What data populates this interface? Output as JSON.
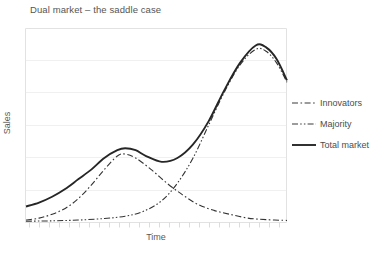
{
  "chart_data": {
    "type": "line",
    "title": "Dual market – the saddle case",
    "xlabel": "Time",
    "ylabel": "Sales",
    "grid": true,
    "grid_axis": "y",
    "xlim": [
      0,
      100
    ],
    "ylim": [
      0,
      100
    ],
    "x_ticks_labeled": false,
    "y_ticks_labeled": false,
    "legend_position": "right",
    "legend": [
      "Innovators",
      "Majority",
      "Total market"
    ],
    "series": [
      {
        "name": "Innovators",
        "style": "dash-dot",
        "color": "#333333",
        "peak_x": 38,
        "peak_y": 35,
        "x": [
          0,
          5,
          10,
          15,
          20,
          25,
          30,
          35,
          38,
          42,
          48,
          54,
          60,
          66,
          72,
          78,
          85,
          92,
          100
        ],
        "y": [
          1,
          2,
          4,
          7,
          12,
          19,
          27,
          34,
          35,
          33,
          27,
          20,
          14,
          9,
          6,
          4,
          2,
          1.2,
          0.8
        ]
      },
      {
        "name": "Majority",
        "style": "dash-dot-dot",
        "color": "#333333",
        "peak_x": 88,
        "peak_y": 89,
        "x": [
          0,
          10,
          20,
          30,
          38,
          45,
          52,
          58,
          64,
          70,
          76,
          82,
          88,
          92,
          96,
          100
        ],
        "y": [
          0.4,
          0.6,
          1.0,
          1.8,
          3.0,
          5.5,
          11,
          20,
          33,
          50,
          67,
          81,
          89,
          88,
          82,
          72
        ]
      },
      {
        "name": "Total market",
        "style": "solid",
        "color": "#262626",
        "hump1_x": 38,
        "hump1_y": 38,
        "saddle_x": 52,
        "saddle_y": 31,
        "peak_x": 88,
        "peak_y": 91,
        "x": [
          0,
          5,
          10,
          15,
          20,
          25,
          30,
          35,
          38,
          42,
          46,
          52,
          58,
          64,
          70,
          76,
          82,
          88,
          92,
          96,
          100
        ],
        "y": [
          8,
          10,
          13,
          17,
          22,
          27,
          33,
          37,
          38,
          37,
          34,
          31,
          33,
          40,
          52,
          68,
          82,
          91,
          90,
          84,
          73
        ]
      }
    ]
  }
}
